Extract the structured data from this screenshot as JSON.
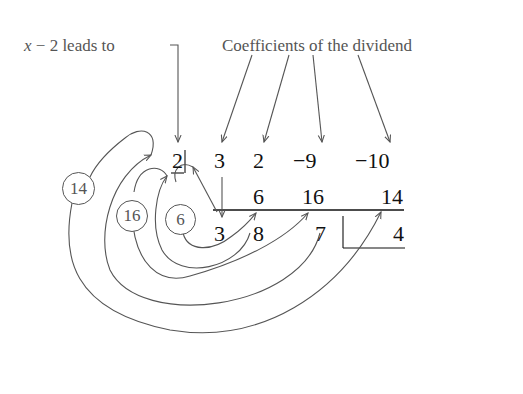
{
  "labels": {
    "divisor_note_var": "x",
    "divisor_note_rest": " − 2 leads to",
    "coefficients_note": "Coefficients of the dividend"
  },
  "synthetic_division": {
    "divisor": "2",
    "row1": [
      "3",
      "2",
      "−9",
      "−10"
    ],
    "row2": [
      "6",
      "16",
      "14"
    ],
    "row3": [
      "3",
      "8",
      "7",
      "4"
    ]
  },
  "circled_products": [
    "14",
    "16",
    "6"
  ],
  "colors": {
    "annotation": "#555555",
    "numbers": "#111111",
    "lines": "#555555"
  }
}
